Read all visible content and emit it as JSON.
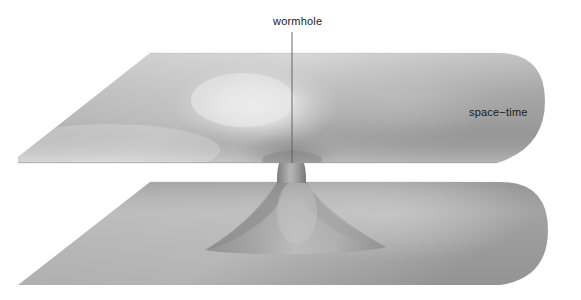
{
  "figure": {
    "title_visible": false,
    "background_color": "#ffffff",
    "labels": {
      "wormhole": "wormhole",
      "spacetime": "space−time"
    },
    "leader_line": {
      "name": "wormhole-leader-line",
      "from_x": 292,
      "from_y": 32,
      "to_x": 292,
      "to_y": 163,
      "color": "#5a5a5a"
    },
    "palette": {
      "surface_light": "#e2e2e2",
      "surface_mid": "#aeaeae",
      "surface_dark": "#8d8d8d",
      "surface_edge": "#9a9a9a",
      "highlight": "#e8e8e8",
      "throat_shadow": "#7e7e7e",
      "label_color": "#1a1a1a"
    },
    "geometry": {
      "upper_sheet": {
        "name": "upper-spacetime-sheet",
        "left_tip_x": 18,
        "left_tip_y": 157,
        "top_edge_y": 53,
        "front_edge_y": 163,
        "right_round_x": 545
      },
      "lower_sheet": {
        "name": "lower-spacetime-sheet",
        "left_tip_x": 18,
        "left_tip_y": 285,
        "back_edge_y": 182,
        "bottom_edge_y": 285,
        "right_round_x": 548
      },
      "throat": {
        "name": "wormhole-throat",
        "center_x": 292,
        "neck_left_x": 277,
        "neck_right_x": 306,
        "top_y": 163,
        "bottom_y": 182,
        "flare_bottom_y": 245
      },
      "depression": {
        "name": "upper-sheet-depression",
        "center_x": 255,
        "center_y": 105,
        "rx": 85,
        "ry": 42
      }
    }
  }
}
